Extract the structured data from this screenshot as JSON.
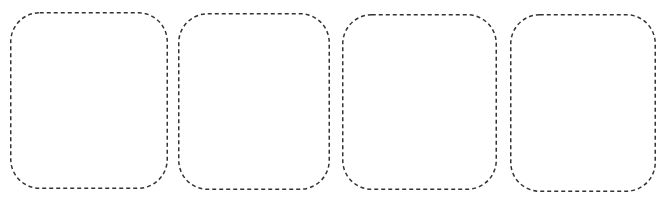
{
  "canvas": {
    "width": 664,
    "height": 202,
    "background_color": "#ffffff"
  },
  "style": {
    "stroke_color": "#333333",
    "stroke_width": 1.5,
    "dash_length": 4,
    "dash_gap": 3,
    "corner_radius": 29,
    "fill_color": "transparent"
  },
  "placeholders": {
    "count": 4,
    "shape": "rounded-rectangle",
    "border_style": "dashed",
    "content": "",
    "items": [
      {
        "id": "placeholder-1",
        "label": "",
        "x": 10,
        "y": 12,
        "width": 158,
        "height": 177
      },
      {
        "id": "placeholder-2",
        "label": "",
        "x": 178,
        "y": 13,
        "width": 152,
        "height": 177
      },
      {
        "id": "placeholder-3",
        "label": "",
        "x": 342,
        "y": 14,
        "width": 155,
        "height": 176
      },
      {
        "id": "placeholder-4",
        "label": "",
        "x": 510,
        "y": 14,
        "width": 146,
        "height": 178
      }
    ]
  }
}
